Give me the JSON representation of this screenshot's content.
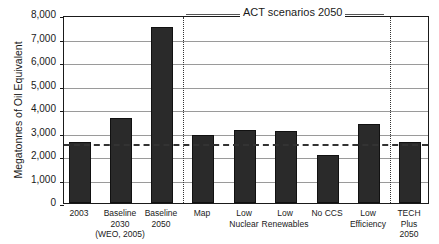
{
  "chart_data": {
    "type": "bar",
    "title": "",
    "xlabel": "",
    "ylabel": "Megatonnes of Oil Equivalent",
    "ylim": [
      0,
      8000
    ],
    "yticks": [
      "0",
      "1,000",
      "2,000",
      "3,000",
      "4,000",
      "5,000",
      "6,000",
      "7,000",
      "8,000"
    ],
    "grid": true,
    "categories": [
      "2003",
      "Baseline\n2030\n(WEO, 2005)",
      "Baseline\n2050",
      "Map",
      "Low\nNuclear",
      "Low\nRenewables",
      "No CCS",
      "Low\nEfficiency",
      "TECH\nPlus\n2050"
    ],
    "values": [
      2600,
      3600,
      7500,
      2900,
      3100,
      3050,
      2050,
      3350,
      2600
    ],
    "reference_line": {
      "value": 2550,
      "style": "dashed",
      "meaning": "2003 level"
    },
    "annotations": [
      {
        "text": "ACT scenarios 2050",
        "spans_categories": [
          "Map",
          "Low\nNuclear",
          "Low\nRenewables",
          "No CCS",
          "Low\nEfficiency"
        ]
      }
    ],
    "group_separators": [
      "between Baseline 2050 and Map",
      "between Low Efficiency and TECH Plus 2050"
    ],
    "bar_color": "#2a2a2a"
  },
  "labels": {
    "ylabel": "Megatonnes of Oil Equivalent",
    "act": "ACT scenarios 2050"
  }
}
